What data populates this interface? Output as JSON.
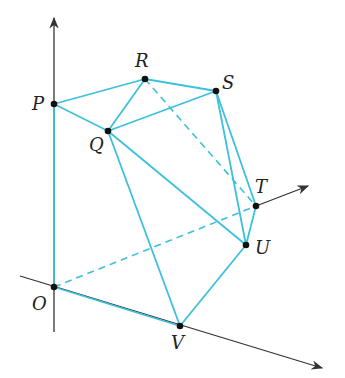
{
  "diagram": {
    "type": "polyhedron-in-3d-axes",
    "colors": {
      "edge": "#3cc0dc",
      "axis": "#333333",
      "point": "#111111",
      "label": "#222222"
    },
    "points": [
      {
        "name": "P",
        "x": 54,
        "y": 104,
        "lx": 32,
        "ly": 110
      },
      {
        "name": "R",
        "x": 145,
        "y": 79,
        "lx": 135,
        "ly": 67
      },
      {
        "name": "Q",
        "x": 108,
        "y": 131,
        "lx": 89,
        "ly": 151
      },
      {
        "name": "S",
        "x": 216,
        "y": 91,
        "lx": 222,
        "ly": 89
      },
      {
        "name": "T",
        "x": 256,
        "y": 206,
        "lx": 255,
        "ly": 193
      },
      {
        "name": "U",
        "x": 246,
        "y": 245,
        "lx": 255,
        "ly": 254
      },
      {
        "name": "O",
        "x": 54,
        "y": 287,
        "lx": 32,
        "ly": 310
      },
      {
        "name": "V",
        "x": 180,
        "y": 326,
        "lx": 171,
        "ly": 349
      }
    ],
    "solid_edges": [
      [
        "P",
        "R"
      ],
      [
        "P",
        "Q"
      ],
      [
        "Q",
        "R"
      ],
      [
        "R",
        "S"
      ],
      [
        "Q",
        "S"
      ],
      [
        "S",
        "T"
      ],
      [
        "S",
        "U"
      ],
      [
        "T",
        "U"
      ],
      [
        "Q",
        "U"
      ],
      [
        "Q",
        "V"
      ],
      [
        "U",
        "V"
      ],
      [
        "O",
        "V"
      ],
      [
        "P",
        "O"
      ]
    ],
    "dashed_edges": [
      [
        "R",
        "T"
      ],
      [
        "O",
        "T"
      ]
    ],
    "axes": [
      {
        "name": "vertical-axis",
        "x1": 54,
        "y1": 332,
        "x2": 54,
        "y2": 18,
        "arrow": true
      },
      {
        "name": "oblique-axis",
        "x1": 20,
        "y1": 276,
        "x2": 322,
        "y2": 368,
        "arrow": true
      },
      {
        "name": "t-axis",
        "x1": 256,
        "y1": 206,
        "x2": 308,
        "y2": 186,
        "arrow": true
      }
    ]
  }
}
